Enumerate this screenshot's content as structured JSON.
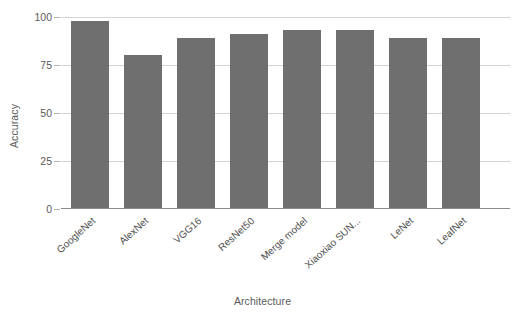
{
  "chart_data": {
    "type": "bar",
    "title": "",
    "xlabel": "Architecture",
    "ylabel": "Accuracy",
    "categories": [
      "GoogleNet",
      "AlexNet",
      "VGG16",
      "ResNet50",
      "Merge model",
      "Xiaoxiao SUN...",
      "LeNet",
      "LeafNet"
    ],
    "values": [
      98,
      80,
      89,
      91,
      93,
      93,
      89,
      89
    ],
    "ylim": [
      0,
      100
    ],
    "yticks": [
      0,
      25,
      50,
      75,
      100
    ],
    "ytick_labels": [
      "0",
      "25",
      "50",
      "75",
      "100"
    ],
    "grid": true,
    "legend": false,
    "bar_color": "#6f6f6f",
    "gridline_color": "#d3d3d3",
    "axis_color": "#8d8d8d",
    "background": "#ffffff"
  }
}
